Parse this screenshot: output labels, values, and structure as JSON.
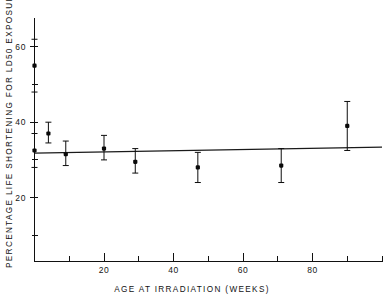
{
  "chart_data": {
    "type": "scatter",
    "title": "",
    "subtitle": "",
    "xlabel": "AGE AT IRRADIATION (WEEKS)",
    "ylabel": "PERCENTAGE LIFE SHORTENING FOR LD50 EXPOSURE",
    "xlim": [
      0,
      100
    ],
    "ylim": [
      0,
      68
    ],
    "grid": false,
    "legend": null,
    "legend_position": "none",
    "x_ticks_major": [
      20,
      40,
      60,
      80
    ],
    "x_ticks_minor": [
      10,
      30,
      50,
      70,
      90,
      100
    ],
    "x_tick_labels": [
      "20",
      "40",
      "60",
      "80"
    ],
    "y_ticks_major": [
      20,
      40,
      60
    ],
    "y_ticks_minor": [
      10,
      30,
      50
    ],
    "y_tick_labels": [
      "20",
      "40",
      "60"
    ],
    "marker_style": "filled-square",
    "error_bar_style": "capped-vertical",
    "series": [
      {
        "name": "Percentage life shortening",
        "x": [
          0,
          0,
          4,
          9,
          20,
          29,
          47,
          71,
          90
        ],
        "y": [
          55.0,
          32.5,
          37.0,
          31.5,
          33.0,
          29.5,
          28.0,
          28.5,
          39.0
        ],
        "err_low": [
          48.0,
          28.0,
          34.5,
          28.5,
          30.0,
          26.5,
          24.0,
          24.0,
          32.5
        ],
        "err_high": [
          62.0,
          37.0,
          40.0,
          35.0,
          36.5,
          33.0,
          32.0,
          33.0,
          45.5
        ]
      }
    ],
    "fit_line": {
      "name": "regression line",
      "x": [
        0,
        100
      ],
      "y": [
        31.8,
        33.4
      ]
    }
  }
}
